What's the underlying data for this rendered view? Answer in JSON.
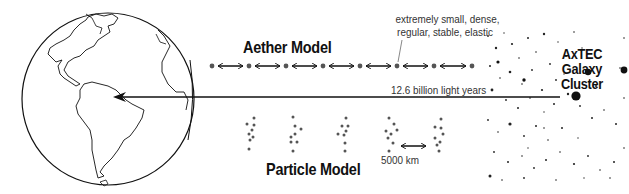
{
  "diagram": {
    "aether_model": {
      "title": "Aether Model",
      "note_line1": "extremely small, dense,",
      "note_line2": "regular, stable, elastic",
      "node_count": 8,
      "node_x": [
        212,
        249,
        286,
        323,
        360,
        397,
        434,
        472
      ],
      "node_y": 66
    },
    "particle_model": {
      "title": "Particle Model",
      "scale_label": "5000 km",
      "cluster_count": 5
    },
    "earth": {
      "label": "Earth (globe)"
    },
    "galaxy_cluster": {
      "title_line1": "AxTEC",
      "title_line2": "Galaxy",
      "title_line3": "Cluster"
    },
    "distance_arrow": {
      "label": "12.6 billion light years",
      "from": "galaxy cluster",
      "to": "Earth"
    },
    "colors": {
      "ink": "#111111",
      "node": "#555555",
      "text": "#333333",
      "background": "#ffffff"
    }
  }
}
